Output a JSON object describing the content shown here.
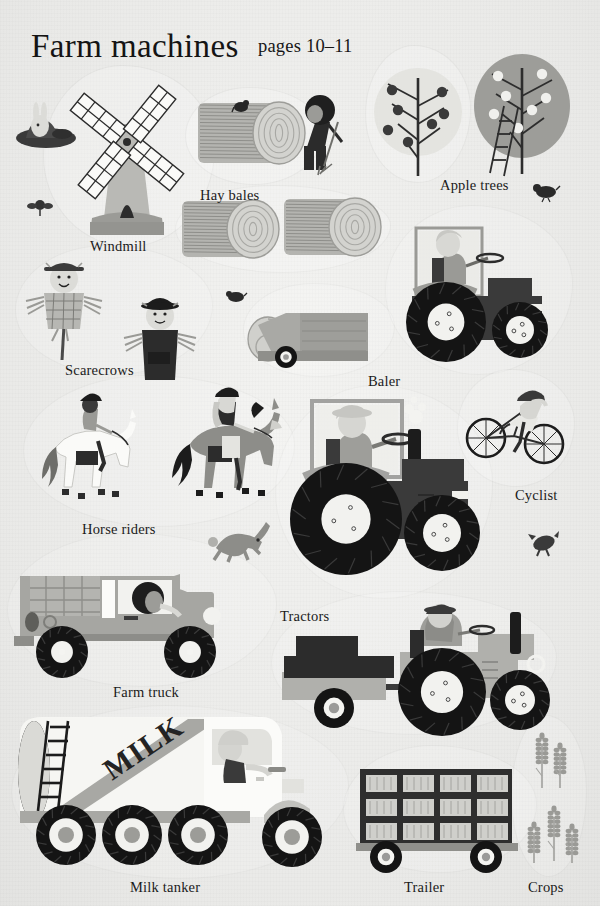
{
  "sheet": {
    "title": "Farm machines",
    "pages": "pages 10–11",
    "background_color": "#efefed",
    "ink_color": "#1b1b1b"
  },
  "palette": {
    "ink": "#1b1b1b",
    "dark": "#2e2e2e",
    "mid_gray": "#8d8d8d",
    "light_gray": "#c3c3c1",
    "pale": "#e2e2de",
    "white": "#fbfbfa",
    "tractor_body": "#3a3a3a",
    "truck_body": "#a6a6a2"
  },
  "labels": [
    {
      "id": "hay-bales",
      "text": "Hay bales",
      "x": 200,
      "y": 187
    },
    {
      "id": "apple-trees",
      "text": "Apple trees",
      "x": 440,
      "y": 177
    },
    {
      "id": "windmill",
      "text": "Windmill",
      "x": 90,
      "y": 238
    },
    {
      "id": "scarecrows",
      "text": "Scarecrows",
      "x": 65,
      "y": 362
    },
    {
      "id": "baler",
      "text": "Baler",
      "x": 368,
      "y": 373
    },
    {
      "id": "cyclist",
      "text": "Cyclist",
      "x": 515,
      "y": 487
    },
    {
      "id": "horse-riders",
      "text": "Horse riders",
      "x": 82,
      "y": 521
    },
    {
      "id": "tractors",
      "text": "Tractors",
      "x": 280,
      "y": 608
    },
    {
      "id": "farm-truck",
      "text": "Farm truck",
      "x": 113,
      "y": 684
    },
    {
      "id": "milk-tanker",
      "text": "Milk tanker",
      "x": 130,
      "y": 879
    },
    {
      "id": "trailer",
      "text": "Trailer",
      "x": 404,
      "y": 879
    },
    {
      "id": "crops",
      "text": "Crops",
      "x": 528,
      "y": 879
    }
  ],
  "stickers": {
    "rabbit_burrow": {
      "name": "rabbit in burrow",
      "x": 14,
      "y": 92,
      "w": 64,
      "h": 54
    },
    "windmill": {
      "name": "windmill",
      "x": 52,
      "y": 70,
      "w": 150,
      "h": 165,
      "sails": 4
    },
    "hay_bale_big": {
      "name": "hay bale",
      "x": 196,
      "y": 97,
      "w": 110,
      "h": 72
    },
    "hay_bale_mid": {
      "name": "hay bale",
      "x": 180,
      "y": 195,
      "w": 100,
      "h": 68
    },
    "hay_bale_mid2": {
      "name": "hay bale",
      "x": 282,
      "y": 193,
      "w": 100,
      "h": 68
    },
    "farmer_fork": {
      "name": "farmer with pitchfork",
      "x": 282,
      "y": 88,
      "w": 62,
      "h": 82
    },
    "bird_on_bale": {
      "name": "bird",
      "x": 232,
      "y": 98,
      "w": 18,
      "h": 16
    },
    "apple_tree_light": {
      "name": "apple tree",
      "x": 372,
      "y": 58,
      "w": 92,
      "h": 118,
      "apples": 7,
      "apple_tone": "dark"
    },
    "apple_tree_dark": {
      "name": "apple tree with ladder",
      "x": 470,
      "y": 48,
      "w": 110,
      "h": 135,
      "apples": 7,
      "apple_tone": "light"
    },
    "flower_left": {
      "name": "flower",
      "x": 28,
      "y": 196,
      "w": 24,
      "h": 20
    },
    "bird_right": {
      "name": "bird",
      "x": 534,
      "y": 182,
      "w": 26,
      "h": 18
    },
    "bird_small": {
      "name": "bird",
      "x": 226,
      "y": 288,
      "w": 20,
      "h": 16
    },
    "scarecrow_plaid": {
      "name": "scarecrow",
      "x": 22,
      "y": 255,
      "w": 84,
      "h": 105
    },
    "scarecrow_dark": {
      "name": "scarecrow",
      "x": 118,
      "y": 290,
      "w": 82,
      "h": 100
    },
    "baler": {
      "name": "baler machine",
      "x": 258,
      "y": 295,
      "w": 120,
      "h": 72
    },
    "hay_bale_small": {
      "name": "hay bale",
      "x": 246,
      "y": 315,
      "w": 44,
      "h": 48
    },
    "tractor_baler": {
      "name": "tractor pulling baler",
      "x": 392,
      "y": 218,
      "w": 168,
      "h": 148
    },
    "horse_white": {
      "name": "horse rider on white horse",
      "x": 32,
      "y": 385,
      "w": 110,
      "h": 125
    },
    "horse_gray": {
      "name": "horse rider on grey horse",
      "x": 168,
      "y": 378,
      "w": 118,
      "h": 130
    },
    "tractor_big": {
      "name": "large tractor",
      "x": 282,
      "y": 395,
      "w": 200,
      "h": 195
    },
    "cyclist": {
      "name": "cyclist on bicycle",
      "x": 466,
      "y": 378,
      "w": 98,
      "h": 98
    },
    "rabbit_running": {
      "name": "running rabbit",
      "x": 208,
      "y": 520,
      "w": 58,
      "h": 42
    },
    "bird_dark": {
      "name": "bird",
      "x": 528,
      "y": 530,
      "w": 30,
      "h": 26
    },
    "farm_truck": {
      "name": "farm truck",
      "x": 14,
      "y": 540,
      "w": 250,
      "h": 135
    },
    "tractor_loader": {
      "name": "tractor with crates",
      "x": 282,
      "y": 600,
      "w": 268,
      "h": 125
    },
    "milk_tanker": {
      "name": "milk tanker truck",
      "x": 20,
      "y": 715,
      "w": 320,
      "h": 155,
      "body_text": "MILK",
      "wheels": 4
    },
    "trailer": {
      "name": "livestock trailer",
      "x": 352,
      "y": 755,
      "w": 175,
      "h": 112,
      "panel_rows": 3,
      "panel_cols": 4,
      "wheels": 2
    },
    "crops_top": {
      "name": "wheat crops",
      "x": 524,
      "y": 728,
      "w": 56,
      "h": 62,
      "stalks": 2
    },
    "crops_bottom": {
      "name": "wheat crops",
      "x": 518,
      "y": 805,
      "w": 66,
      "h": 60,
      "stalks": 3
    }
  }
}
